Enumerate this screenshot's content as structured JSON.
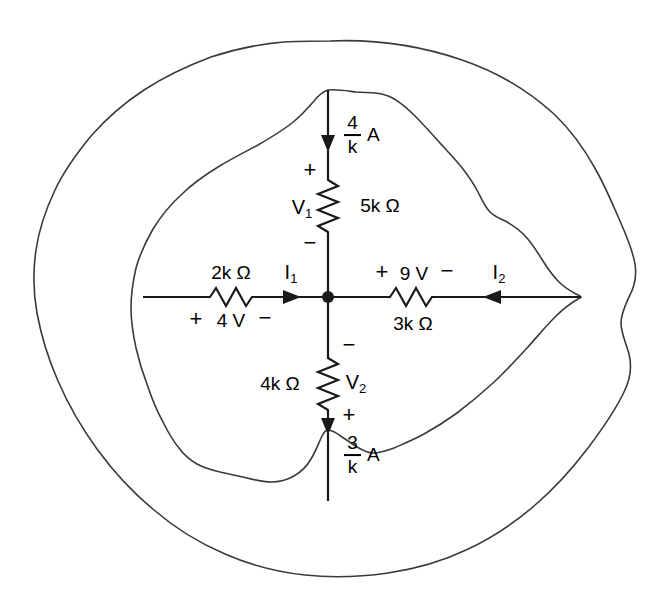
{
  "diagram": {
    "line_color": "#1a1a1a",
    "boundary_color": "#3a3a3a",
    "background": "#ffffff",
    "node_label": "center-node"
  },
  "sources": {
    "top_current": {
      "numerator": "4",
      "denominator": "k",
      "unit": "A",
      "direction": "down"
    },
    "bottom_current": {
      "numerator": "3",
      "denominator": "k",
      "unit": "A",
      "direction": "down"
    }
  },
  "branches": {
    "top": {
      "resistor": "5k Ω",
      "voltage_name": "V",
      "voltage_sub": "1",
      "plus": "+",
      "minus": "−"
    },
    "left": {
      "resistor": "2k Ω",
      "source_plus": "+",
      "source_value": "4 V",
      "source_minus": "−",
      "current_name": "I",
      "current_sub": "1",
      "current_direction": "right"
    },
    "right": {
      "resistor": "3k Ω",
      "source_plus": "+",
      "source_value": "9 V",
      "source_minus": "−",
      "current_name": "I",
      "current_sub": "2",
      "current_direction": "left"
    },
    "bottom": {
      "resistor": "4k Ω",
      "voltage_name": "V",
      "voltage_sub": "2",
      "plus": "+",
      "minus": "−"
    }
  }
}
